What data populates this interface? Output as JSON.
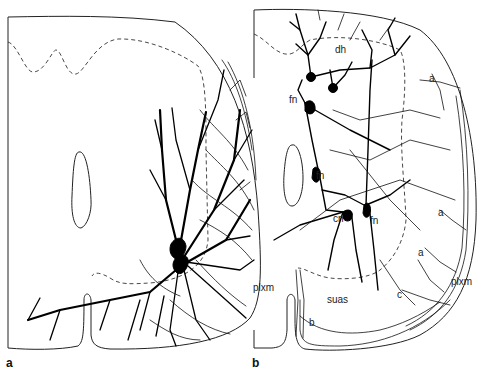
{
  "figure": {
    "type": "neuroanatomical line drawing",
    "panels": [
      {
        "id": "a",
        "label": "a",
        "labels": []
      },
      {
        "id": "b",
        "label": "b",
        "labels": [
          {
            "text": "dh",
            "x": 335,
            "y": 51
          },
          {
            "text": "fn",
            "x": 294,
            "y": 99
          },
          {
            "text": "fn",
            "x": 316,
            "y": 175
          },
          {
            "text": "cn",
            "x": 333,
            "y": 219
          },
          {
            "text": "fn",
            "x": 370,
            "y": 220
          },
          {
            "text": "a",
            "x": 429,
            "y": 78
          },
          {
            "text": "a",
            "x": 438,
            "y": 212
          },
          {
            "text": "a",
            "x": 418,
            "y": 252
          },
          {
            "text": "plxm",
            "x": 448,
            "y": 281
          },
          {
            "text": "plxm",
            "x": 253,
            "y": 285
          },
          {
            "text": "suas",
            "x": 327,
            "y": 299
          },
          {
            "text": "c",
            "x": 396,
            "y": 294
          },
          {
            "text": "b",
            "x": 309,
            "y": 322
          }
        ]
      }
    ],
    "panel_a_label_pos": {
      "x": 6,
      "y": 357
    },
    "panel_b_label_pos": {
      "x": 252,
      "y": 357
    },
    "colors": {
      "ink": "#000000",
      "background": "#ffffff"
    }
  }
}
